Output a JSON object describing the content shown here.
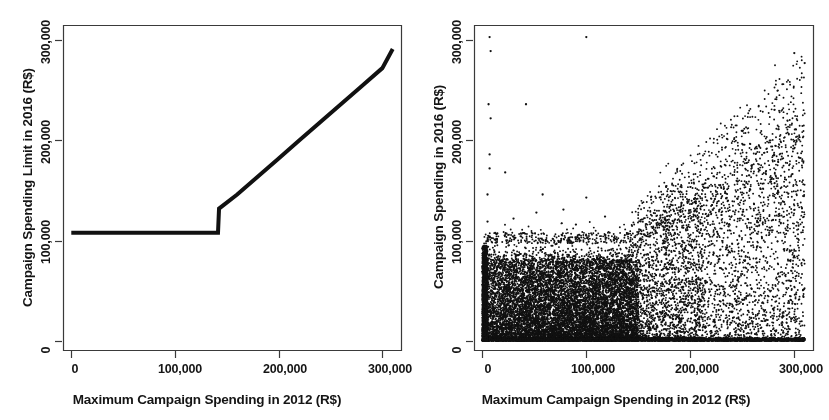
{
  "figure": {
    "width": 829,
    "height": 420,
    "background": "#ffffff",
    "ink_color": "#111111",
    "panel_count": 2
  },
  "chart_data": [
    {
      "panel": "left",
      "type": "line",
      "title": "",
      "xlabel": "Maximum Campaign Spending in 2012 (R$)",
      "ylabel": "Campaign Spending Limit in 2016 (R$)",
      "xlim": [
        -8000,
        318000
      ],
      "ylim": [
        -9000,
        315000
      ],
      "xticks": [
        0,
        100000,
        200000,
        300000
      ],
      "xticklabels": [
        "0",
        "100,000",
        "200,000",
        "300,000"
      ],
      "yticks": [
        0,
        100000,
        200000,
        300000
      ],
      "yticklabels": [
        "0",
        "100,000",
        "200,000",
        "300,000"
      ],
      "grid": false,
      "legend": null,
      "line_color": "#111111",
      "line_width": 4,
      "description": "Deterministic running-variable assignment: flat spending limit of R$108,000 for all 2012 maxima up to the R$142,857 cutoff, then an upward jump to R$132,000 followed by a linear increase in the spending limit.",
      "series": [
        {
          "name": "Spending limit rule",
          "x": [
            0,
            141500,
            141500,
            142500,
            142500,
            160000,
            180000,
            200000,
            220000,
            240000,
            260000,
            280000,
            300000,
            310000
          ],
          "y": [
            108000,
            108000,
            108000,
            132000,
            132000,
            146000,
            164000,
            182000,
            200000,
            218000,
            236000,
            254000,
            272000,
            291000
          ]
        }
      ],
      "annotations": [
        {
          "label": "cutoff",
          "x": 142000,
          "y_before": 108000,
          "y_after": 132000
        }
      ]
    },
    {
      "panel": "right",
      "type": "scatter",
      "title": "",
      "xlabel": "Maximum Campaign Spending in 2012 (R$)",
      "ylabel": "Campaign Spending in 2016 (R$)",
      "xlim": [
        -8000,
        318000
      ],
      "ylim": [
        -9000,
        315000
      ],
      "xticks": [
        0,
        100000,
        200000,
        300000
      ],
      "xticklabels": [
        "0",
        "100,000",
        "200,000",
        "300,000"
      ],
      "yticks": [
        0,
        100000,
        200000,
        300000
      ],
      "yticklabels": [
        "0",
        "100,000",
        "200,000",
        "300,000"
      ],
      "grid": false,
      "legend": null,
      "marker": "filled-circle",
      "marker_size_px": 1.9,
      "marker_color": "#111111",
      "n_points": 9000,
      "description": "Dense scatter of realized 2016 campaign spending against the 2012 maximum. Below the R$142,857 cutoff, realized spending is capped near R$108,000 and piles up heavily between 0 and R$100,000. Above the cutoff, the ceiling relaxes and the upper envelope of points rises roughly linearly toward R$300,000, with a thin band of outliers scattered up to R$300,000 at low 2012 maxima.",
      "structure": {
        "cutoff_x": 142857,
        "cap_below_cutoff": 108000,
        "cap_slope_above_cutoff": 0.93,
        "mass_concentration_y": [
          0,
          70000
        ],
        "sparse_outlier_region": "x < 110,000 and y > 110,000"
      }
    }
  ],
  "panels": {
    "left": {
      "x_axis_title": "Maximum Campaign Spending in 2012 (R$)",
      "y_axis_title": "Campaign Spending Limit in 2016 (R$)",
      "x_tick_labels": [
        "0",
        "100,000",
        "200,000",
        "300,000"
      ],
      "y_tick_labels": [
        "0",
        "100,000",
        "200,000",
        "300,000"
      ]
    },
    "right": {
      "x_axis_title": "Maximum Campaign Spending in 2012 (R$)",
      "y_axis_title": "Campaign Spending in 2016 (R$)",
      "x_tick_labels": [
        "0",
        "100,000",
        "200,000",
        "300,000"
      ],
      "y_tick_labels": [
        "0",
        "100,000",
        "200,000",
        "300,000"
      ]
    }
  }
}
